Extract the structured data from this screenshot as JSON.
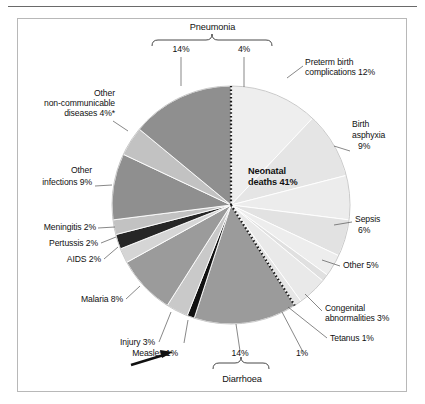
{
  "figure": {
    "center_label_line1": "Neonatal",
    "center_label_line2": "deaths 41%",
    "brace_top_label": "Pneumonia",
    "brace_top_left_value": "14%",
    "brace_top_right_value": "4%",
    "brace_bottom_label": "Diarrhoea",
    "brace_bottom_left_value": "14%",
    "brace_bottom_right_value": "1%",
    "arrow_icon": "arrow-right-up"
  },
  "labels": {
    "preterm": "Preterm birth",
    "preterm2": "complications 12%",
    "asphyxia1": "Birth",
    "asphyxia2": "asphyxia",
    "asphyxia3": "9%",
    "sepsis1": "Sepsis",
    "sepsis2": "6%",
    "other_neonatal": "Other 5%",
    "congenital1": "Congenital",
    "congenital2": "abnormalities 3%",
    "tetanus": "Tetanus 1%",
    "other_ncd1": "Other",
    "other_ncd2": "non-communicable",
    "other_ncd3": "diseases 4%*",
    "other_inf1": "Other",
    "other_inf2": "infections 9%",
    "meningitis": "Meningitis 2%",
    "pertussis": "Pertussis 2%",
    "aids": "AIDS 2%",
    "malaria": "Malaria 8%",
    "injury": "Injury 3%",
    "measles": "Measles 1%"
  },
  "chart_data": {
    "type": "pie",
    "title": "",
    "total": "100%",
    "start_angle_deg": 0,
    "direction": "clockwise",
    "group_annotations": [
      {
        "name": "Pneumonia",
        "total": "18%",
        "parts": [
          "14%",
          "4%"
        ]
      },
      {
        "name": "Diarrhoea",
        "total": "15%",
        "parts": [
          "14%",
          "1%"
        ]
      },
      {
        "name": "Neonatal deaths",
        "total": "41%"
      }
    ],
    "footnote": "*",
    "slices": [
      {
        "label": "Preterm birth complications",
        "value": 12,
        "display": "Preterm birth complications 12%",
        "color": "#eeeeee",
        "group": "neonatal"
      },
      {
        "label": "Birth asphyxia",
        "value": 9,
        "display": "Birth asphyxia 9%",
        "color": "#e5e5e5",
        "group": "neonatal"
      },
      {
        "label": "Sepsis",
        "value": 6,
        "display": "Sepsis 6%",
        "color": "#ececec",
        "group": "neonatal"
      },
      {
        "label": "Other",
        "value": 5,
        "display": "Other 5%",
        "color": "#e2e2e2",
        "group": "neonatal"
      },
      {
        "label": "Congenital abnormalities",
        "value": 3,
        "display": "Congenital abnormalities 3%",
        "color": "#ededed",
        "group": "neonatal"
      },
      {
        "label": "Tetanus",
        "value": 1,
        "display": "Tetanus 1%",
        "color": "#e0e0e0",
        "group": "neonatal"
      },
      {
        "label": "Pneumonia (neonatal)",
        "value": 4,
        "display": "4%",
        "color": "#e9e9e9",
        "group": "neonatal"
      },
      {
        "label": "Diarrhoea (neonatal)",
        "value": 1,
        "display": "1%",
        "color": "#e6e6e6",
        "group": "neonatal"
      },
      {
        "label": "Diarrhoea",
        "value": 14,
        "display": "14%",
        "color": "#9b9b9b",
        "group": "post-neonatal"
      },
      {
        "label": "Measles",
        "value": 1,
        "display": "Measles 1%",
        "color": "#111111",
        "group": "post-neonatal"
      },
      {
        "label": "Injury",
        "value": 3,
        "display": "Injury 3%",
        "color": "#c9c9c9",
        "group": "post-neonatal"
      },
      {
        "label": "Malaria",
        "value": 8,
        "display": "Malaria 8%",
        "color": "#9b9b9b",
        "group": "post-neonatal"
      },
      {
        "label": "AIDS",
        "value": 2,
        "display": "AIDS 2%",
        "color": "#d5d5d5",
        "group": "post-neonatal"
      },
      {
        "label": "Pertussis",
        "value": 2,
        "display": "Pertussis 2%",
        "color": "#262626",
        "group": "post-neonatal"
      },
      {
        "label": "Meningitis",
        "value": 2,
        "display": "Meningitis 2%",
        "color": "#c2c2c2",
        "group": "post-neonatal"
      },
      {
        "label": "Other infections",
        "value": 9,
        "display": "Other infections 9%",
        "color": "#8f8f8f",
        "group": "post-neonatal"
      },
      {
        "label": "Other non-communicable diseases",
        "value": 4,
        "display": "Other non-communicable diseases 4%*",
        "color": "#c2c2c2",
        "group": "post-neonatal"
      },
      {
        "label": "Pneumonia",
        "value": 14,
        "display": "14%",
        "color": "#8f8f8f",
        "group": "post-neonatal"
      }
    ]
  }
}
